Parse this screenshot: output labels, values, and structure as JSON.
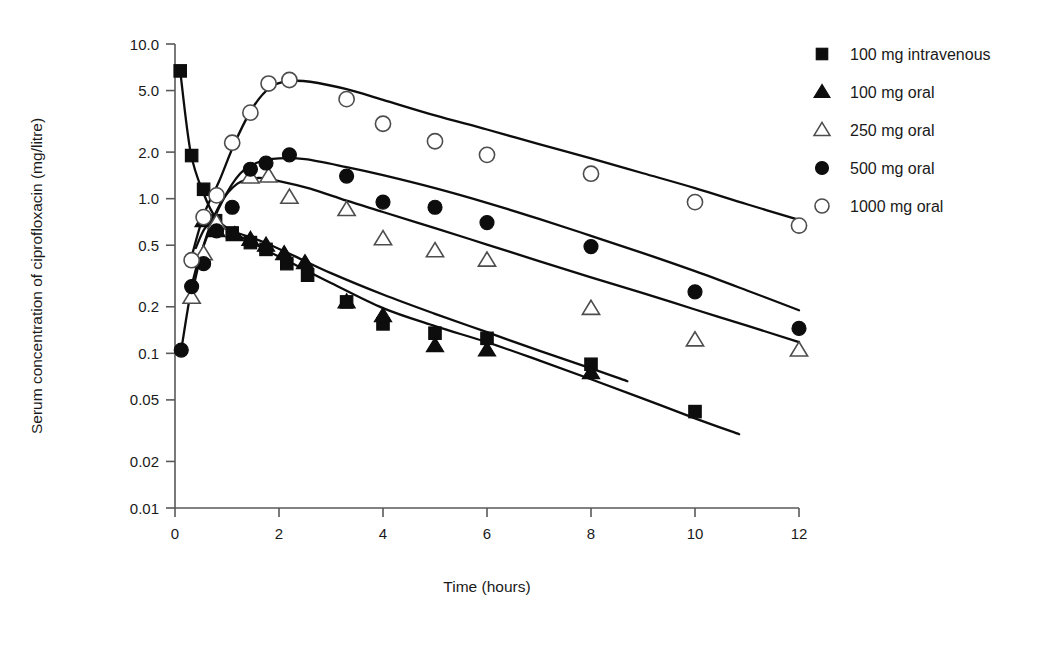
{
  "chart_data": {
    "type": "line",
    "title": "",
    "xlabel": "Time (hours)",
    "ylabel": "Serum concentration of ciprofloxacin (mg/litre)",
    "x_scale": "linear",
    "y_scale": "log",
    "xlim": [
      0,
      12
    ],
    "ylim": [
      0.01,
      10.0
    ],
    "xticks": [
      0,
      2,
      4,
      6,
      8,
      10,
      12
    ],
    "xtick_labels": [
      "0",
      "2",
      "4",
      "6",
      "8",
      "10",
      "12"
    ],
    "yticks": [
      10.0,
      5.0,
      2.0,
      1.0,
      0.5,
      0.2,
      0.1,
      0.05,
      0.02,
      0.01
    ],
    "ytick_labels": [
      "10.0",
      "5.0",
      "2.0",
      "1.0",
      "0.5",
      "0.2",
      "0.1",
      "0.05",
      "0.02",
      "0.01"
    ],
    "grid": false,
    "legend_position": "right",
    "series": [
      {
        "name": "100 mg intravenous",
        "marker": "filled-square",
        "points": [
          [
            0.1,
            6.7
          ],
          [
            0.32,
            1.9
          ],
          [
            0.55,
            1.15
          ],
          [
            0.78,
            0.72
          ],
          [
            1.1,
            0.6
          ],
          [
            1.45,
            0.52
          ],
          [
            1.75,
            0.47
          ],
          [
            2.15,
            0.38
          ],
          [
            2.55,
            0.32
          ],
          [
            3.3,
            0.215
          ],
          [
            4.0,
            0.155
          ],
          [
            5.0,
            0.135
          ],
          [
            6.0,
            0.125
          ],
          [
            8.0,
            0.085
          ],
          [
            10.0,
            0.042
          ]
        ],
        "curve": [
          [
            0.1,
            6.7
          ],
          [
            0.3,
            2.0
          ],
          [
            0.55,
            1.08
          ],
          [
            0.8,
            0.74
          ],
          [
            1.2,
            0.585
          ],
          [
            1.7,
            0.475
          ],
          [
            2.3,
            0.375
          ],
          [
            3.0,
            0.285
          ],
          [
            4.0,
            0.196
          ],
          [
            5.0,
            0.15
          ],
          [
            6.0,
            0.118
          ],
          [
            7.0,
            0.09
          ],
          [
            8.0,
            0.068
          ],
          [
            9.0,
            0.051
          ],
          [
            10.0,
            0.038
          ],
          [
            10.85,
            0.03
          ]
        ]
      },
      {
        "name": "100 mg oral",
        "marker": "filled-triangle",
        "points": [
          [
            0.55,
            0.72
          ],
          [
            0.8,
            0.62
          ],
          [
            1.15,
            0.585
          ],
          [
            1.45,
            0.545
          ],
          [
            1.75,
            0.5
          ],
          [
            2.1,
            0.44
          ],
          [
            2.5,
            0.385
          ],
          [
            3.3,
            0.215
          ],
          [
            4.0,
            0.175
          ],
          [
            5.0,
            0.112
          ],
          [
            6.0,
            0.105
          ],
          [
            8.0,
            0.075
          ]
        ],
        "curve": [
          [
            0.4,
            0.48
          ],
          [
            0.6,
            0.66
          ],
          [
            0.85,
            0.66
          ],
          [
            1.2,
            0.6
          ],
          [
            1.7,
            0.525
          ],
          [
            2.3,
            0.425
          ],
          [
            3.0,
            0.33
          ],
          [
            4.0,
            0.24
          ],
          [
            5.0,
            0.18
          ],
          [
            6.0,
            0.137
          ],
          [
            7.0,
            0.104
          ],
          [
            8.0,
            0.08
          ],
          [
            8.7,
            0.066
          ]
        ]
      },
      {
        "name": "250 mg oral",
        "marker": "open-triangle",
        "points": [
          [
            0.32,
            0.23
          ],
          [
            0.55,
            0.44
          ],
          [
            0.8,
            0.7
          ],
          [
            1.45,
            1.38
          ],
          [
            1.8,
            1.4
          ],
          [
            2.2,
            1.02
          ],
          [
            3.3,
            0.85
          ],
          [
            4.0,
            0.55
          ],
          [
            5.0,
            0.46
          ],
          [
            6.0,
            0.4
          ],
          [
            8.0,
            0.195
          ],
          [
            10.0,
            0.122
          ],
          [
            12.0,
            0.105
          ]
        ],
        "curve": [
          [
            0.3,
            0.22
          ],
          [
            0.55,
            0.5
          ],
          [
            0.85,
            0.9
          ],
          [
            1.2,
            1.25
          ],
          [
            1.6,
            1.36
          ],
          [
            2.0,
            1.3
          ],
          [
            2.6,
            1.16
          ],
          [
            3.3,
            0.97
          ],
          [
            4.0,
            0.82
          ],
          [
            5.0,
            0.645
          ],
          [
            6.0,
            0.505
          ],
          [
            7.0,
            0.395
          ],
          [
            8.0,
            0.31
          ],
          [
            9.0,
            0.245
          ],
          [
            10.0,
            0.192
          ],
          [
            11.0,
            0.151
          ],
          [
            12.0,
            0.118
          ]
        ]
      },
      {
        "name": "500 mg oral",
        "marker": "filled-circle",
        "points": [
          [
            0.12,
            0.105
          ],
          [
            0.32,
            0.27
          ],
          [
            0.55,
            0.38
          ],
          [
            0.8,
            0.62
          ],
          [
            1.1,
            0.88
          ],
          [
            1.45,
            1.55
          ],
          [
            1.75,
            1.7
          ],
          [
            2.2,
            1.92
          ],
          [
            3.3,
            1.4
          ],
          [
            4.0,
            0.95
          ],
          [
            5.0,
            0.88
          ],
          [
            6.0,
            0.7
          ],
          [
            8.0,
            0.49
          ],
          [
            10.0,
            0.25
          ],
          [
            12.0,
            0.145
          ]
        ],
        "curve": [
          [
            0.12,
            0.105
          ],
          [
            0.35,
            0.3
          ],
          [
            0.6,
            0.55
          ],
          [
            0.9,
            0.95
          ],
          [
            1.25,
            1.45
          ],
          [
            1.6,
            1.72
          ],
          [
            2.0,
            1.82
          ],
          [
            2.5,
            1.8
          ],
          [
            3.3,
            1.6
          ],
          [
            4.0,
            1.42
          ],
          [
            5.0,
            1.17
          ],
          [
            6.0,
            0.94
          ],
          [
            7.0,
            0.74
          ],
          [
            8.0,
            0.575
          ],
          [
            9.0,
            0.445
          ],
          [
            10.0,
            0.34
          ],
          [
            11.0,
            0.255
          ],
          [
            12.0,
            0.19
          ]
        ]
      },
      {
        "name": "1000 mg oral",
        "marker": "open-circle",
        "points": [
          [
            0.32,
            0.4
          ],
          [
            0.55,
            0.76
          ],
          [
            0.8,
            1.05
          ],
          [
            1.1,
            2.3
          ],
          [
            1.45,
            3.6
          ],
          [
            1.8,
            5.55
          ],
          [
            2.2,
            5.85
          ],
          [
            3.3,
            4.4
          ],
          [
            4.0,
            3.05
          ],
          [
            5.0,
            2.35
          ],
          [
            6.0,
            1.92
          ],
          [
            8.0,
            1.45
          ],
          [
            10.0,
            0.95
          ],
          [
            12.0,
            0.67
          ]
        ],
        "curve": [
          [
            0.3,
            0.4
          ],
          [
            0.55,
            0.78
          ],
          [
            0.85,
            1.3
          ],
          [
            1.15,
            2.3
          ],
          [
            1.5,
            3.9
          ],
          [
            1.85,
            5.3
          ],
          [
            2.2,
            5.75
          ],
          [
            2.6,
            5.7
          ],
          [
            3.3,
            5.1
          ],
          [
            4.0,
            4.35
          ],
          [
            5.0,
            3.45
          ],
          [
            6.0,
            2.8
          ],
          [
            7.0,
            2.25
          ],
          [
            8.0,
            1.82
          ],
          [
            9.0,
            1.46
          ],
          [
            10.0,
            1.17
          ],
          [
            11.0,
            0.92
          ],
          [
            12.0,
            0.73
          ]
        ]
      }
    ]
  },
  "legend": {
    "items": [
      {
        "label": "100 mg intravenous",
        "marker": "filled-square"
      },
      {
        "label": "100 mg oral",
        "marker": "filled-triangle"
      },
      {
        "label": "250 mg oral",
        "marker": "open-triangle"
      },
      {
        "label": "500 mg oral",
        "marker": "filled-circle"
      },
      {
        "label": "1000 mg oral",
        "marker": "open-circle"
      }
    ]
  },
  "colors": {
    "ink": "#0d0d0d",
    "axis": "#595959",
    "open_marker_fill": "#ffffff",
    "background": "#ffffff"
  }
}
